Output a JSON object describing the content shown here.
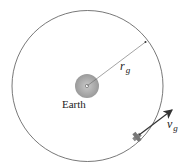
{
  "diagram": {
    "earth_label": "Earth",
    "radius_label": "r",
    "radius_subscript": "g",
    "velocity_label": "v",
    "velocity_subscript": "g",
    "colors": {
      "orbit": "#555555",
      "earth": "#a8a8a8",
      "arrow": "#333333"
    }
  }
}
